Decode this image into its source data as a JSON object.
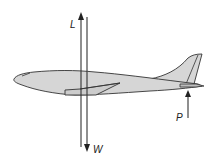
{
  "diagram": {
    "colors": {
      "fill": "#d6d6d6",
      "stroke": "#333333",
      "background": "#ffffff"
    },
    "forces": [
      {
        "id": "lift",
        "label": "L",
        "direction": "up"
      },
      {
        "id": "weight",
        "label": "W",
        "direction": "down"
      },
      {
        "id": "tail",
        "label": "P",
        "direction": "up"
      }
    ]
  }
}
